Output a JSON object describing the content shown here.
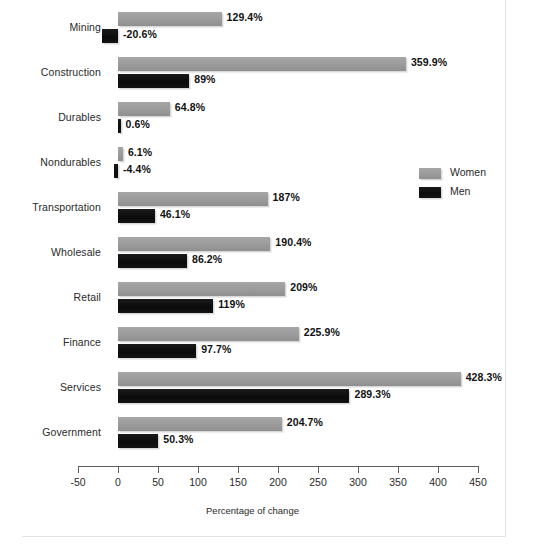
{
  "chart_data": {
    "type": "bar",
    "orientation": "horizontal",
    "title": "",
    "xlabel": "Percentage of change",
    "ylabel": "",
    "xlim": [
      -50,
      480
    ],
    "xticks": [
      -50,
      0,
      50,
      100,
      150,
      200,
      250,
      300,
      350,
      400,
      450
    ],
    "xtick_labels": [
      "-50",
      "0",
      "50",
      "100",
      "150",
      "200",
      "250",
      "300",
      "350",
      "400",
      "450"
    ],
    "grid": false,
    "legend_position": "right-middle",
    "categories": [
      "Mining",
      "Construction",
      "Durables",
      "Nondurables",
      "Transportation",
      "Wholesale",
      "Retail",
      "Finance",
      "Services",
      "Government"
    ],
    "series": [
      {
        "name": "Women",
        "color": "#9a9a9a",
        "values": [
          129.4,
          359.9,
          64.8,
          6.1,
          187,
          190.4,
          209,
          225.9,
          428.3,
          204.7
        ],
        "labels": [
          "129.4%",
          "359.9%",
          "64.8%",
          "6.1%",
          "187%",
          "190.4%",
          "209%",
          "225.9%",
          "428.3%",
          "204.7%"
        ]
      },
      {
        "name": "Men",
        "color": "#111111",
        "values": [
          -20.6,
          89,
          0.6,
          -4.4,
          46.1,
          86.2,
          119,
          97.7,
          289.3,
          50.3
        ],
        "labels": [
          "-20.6%",
          "89%",
          "0.6%",
          "-4.4%",
          "46.1%",
          "86.2%",
          "119%",
          "97.7%",
          "289.3%",
          "50.3%"
        ]
      }
    ]
  },
  "legend": {
    "entries": [
      {
        "label": "Women"
      },
      {
        "label": "Men"
      }
    ]
  },
  "colors": {
    "women": "#9a9a9a",
    "men": "#111111",
    "axis": "#5d5d5d",
    "text": "#2a2a2a",
    "frame": "#e2e2e2"
  }
}
